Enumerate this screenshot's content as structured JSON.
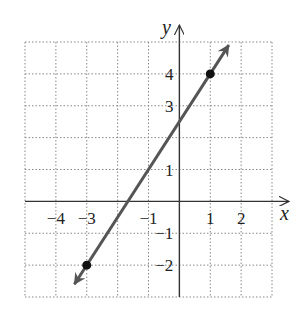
{
  "chart_data": {
    "type": "line",
    "title": "",
    "xlabel": "x",
    "ylabel": "y",
    "xlim": [
      -5,
      3
    ],
    "ylim": [
      -3,
      5
    ],
    "grid": true,
    "x_tick_labels": [
      "−4",
      "−3",
      "−1",
      "1",
      "2"
    ],
    "x_tick_values": [
      -4,
      -3,
      -1,
      1,
      2
    ],
    "y_tick_labels": [
      "4",
      "3",
      "1",
      "−1",
      "−2"
    ],
    "y_tick_values": [
      4,
      3,
      1,
      -1,
      -2
    ],
    "series": [
      {
        "name": "line",
        "equation": "y = 1.5x + 2.5",
        "points": [
          {
            "x": -3,
            "y": -2
          },
          {
            "x": 1,
            "y": 4
          }
        ],
        "color": "#555555",
        "arrows": "both"
      }
    ]
  },
  "labels": {
    "x_axis": "x",
    "y_axis": "y"
  }
}
